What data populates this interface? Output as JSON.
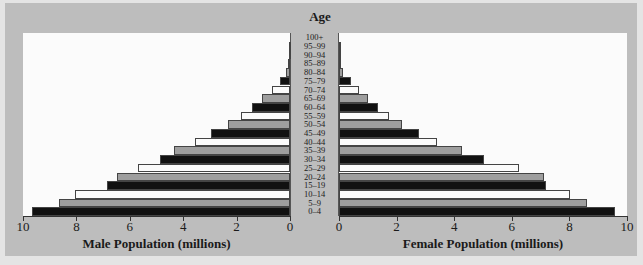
{
  "chart_data": {
    "type": "bar",
    "subtype": "population-pyramid",
    "title": "Age",
    "categories": [
      "0–4",
      "5–9",
      "10–14",
      "15–19",
      "20–24",
      "25–29",
      "30–34",
      "35–39",
      "40–44",
      "45–49",
      "50–54",
      "55–59",
      "60–64",
      "65–69",
      "70–74",
      "75–79",
      "80–84",
      "85–89",
      "90–94",
      "95–99",
      "100+"
    ],
    "series": [
      {
        "name": "Male Population (millions)",
        "values": [
          9.65,
          8.65,
          8.05,
          6.85,
          6.48,
          5.7,
          4.87,
          4.34,
          3.56,
          2.96,
          2.32,
          1.84,
          1.42,
          1.05,
          0.67,
          0.37,
          0.15,
          0.07,
          0.03,
          0.01,
          0.0
        ]
      },
      {
        "name": "Female Population (millions)",
        "values": [
          9.58,
          8.6,
          8.02,
          7.19,
          7.12,
          6.25,
          5.03,
          4.27,
          3.4,
          2.77,
          2.18,
          1.73,
          1.35,
          1.0,
          0.7,
          0.42,
          0.15,
          0.05,
          0.02,
          0.01,
          0.0
        ]
      }
    ],
    "bar_fill_cycle": [
      "black",
      "gray",
      "white"
    ],
    "xlabel_left": "Male Population (millions)",
    "xlabel_right": "Female Population (millions)",
    "ylabel": "Age",
    "xlim": [
      0,
      10
    ],
    "male_ticks": [
      "10",
      "8",
      "6",
      "4",
      "2",
      "0"
    ],
    "female_ticks": [
      "0",
      "2",
      "4",
      "6",
      "8",
      "10"
    ],
    "grid": false,
    "legend": "none"
  }
}
